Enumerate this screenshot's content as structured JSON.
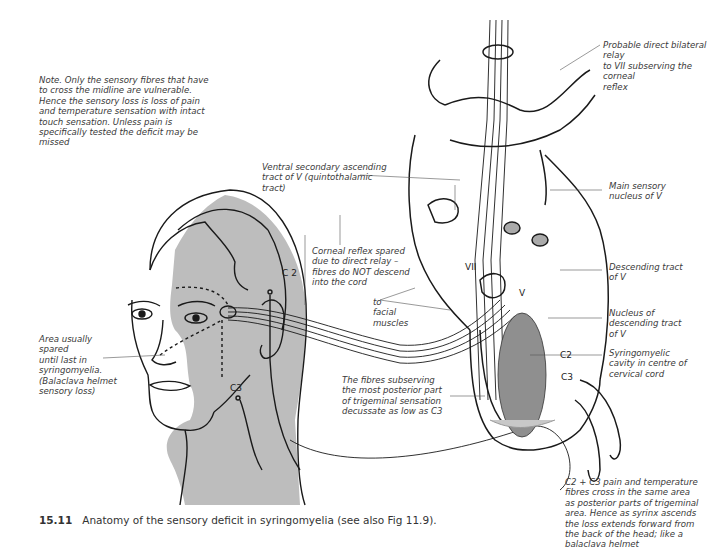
{
  "figure": {
    "number": "15.11",
    "caption": "Anatomy of the sensory deficit in syringomyelia (see also Fig 11.9)."
  },
  "annotations": {
    "note": "Note.  Only the sensory fibres that have\nto cross the midline are vulnerable.\nHence the sensory loss is loss of pain\nand temperature sensation with intact\ntouch sensation.  Unless pain is\nspecifically tested the deficit may be\nmissed",
    "relay": "Probable direct bilateral relay\nto VII subserving the corneal\nreflex",
    "ventral_tract": "Ventral secondary ascending\ntract of V (quintothalamic\ntract)",
    "main_sensory": "Main sensory\nnucleus of V",
    "corneal_reflex": "Corneal reflex spared\ndue to direct relay –\nfibres do NOT descend\ninto the cord",
    "facial_muscles": "to\nfacial\nmuscles",
    "descending_tract": "Descending tract\nof V",
    "nucleus_descending": "Nucleus of\ndescending tract\nof V",
    "area_spared": "Area usually\nspared\nuntil last in\nsyringomyelia.\n(Balaclava helmet\nsensory loss)",
    "syrinx": "Syringomyelic\ncavity in centre of\ncervical cord",
    "posterior_fibres": "The fibres subserving\nthe most posterior part\nof trigeminal sensation\ndecussate as low as C3",
    "c2c3_note": "C2 + C3 pain and temperature\nfibres cross in the same area\nas posterior parts of trigeminal\narea.  Hence as syrinx ascends\nthe loss extends forward from\nthe back of the head; like a\nbalaclava helmet"
  },
  "labels": {
    "c2_head": "C 2",
    "c3_head": "C3",
    "vii": "VII",
    "v": "V",
    "c2_cord": "C2",
    "c3_cord": "C3"
  },
  "colors": {
    "shade": "#b8b8b8",
    "syrinx": "#8f8f8f",
    "line": "#1a1a1a"
  }
}
